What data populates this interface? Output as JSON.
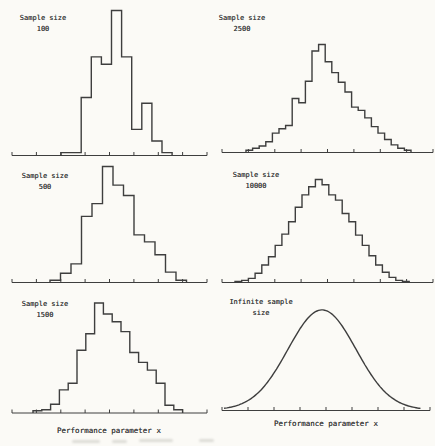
{
  "page": {
    "background": "#fbfaf6",
    "ink": "#3e3e3e"
  },
  "xlabels": {
    "left": "Performance parameter x",
    "right": "Performance parameter x"
  },
  "chart_data": [
    {
      "type": "histogram",
      "position": "top-left",
      "title_lines": [
        "Sample size",
        "100"
      ],
      "xlabel": "Performance parameter x",
      "ylabel": "",
      "tick_labels": [],
      "values": [
        0.02,
        0.02,
        0.4,
        0.68,
        0.63,
        1.0,
        0.68,
        0.18,
        0.36,
        0.1,
        0.02
      ],
      "layout": {
        "axis_x": [
          12,
          207
        ],
        "axis_y": 155.5,
        "ticks": 9,
        "bars_x0": 61,
        "bar_width": 10.1,
        "peak_height": 145
      }
    },
    {
      "type": "histogram",
      "position": "top-right",
      "title_lines": [
        "Sample size",
        "2500"
      ],
      "xlabel": "Performance parameter x",
      "ylabel": "",
      "tick_labels": [],
      "values": [
        0.02,
        0.04,
        0.06,
        0.1,
        0.18,
        0.22,
        0.25,
        0.5,
        0.46,
        0.66,
        0.94,
        1.0,
        0.84,
        0.74,
        0.65,
        0.56,
        0.42,
        0.39,
        0.32,
        0.24,
        0.18,
        0.12,
        0.07,
        0.04,
        0.02
      ],
      "layout": {
        "axis_x": [
          222,
          433
        ],
        "axis_y": 152.5,
        "ticks": 9,
        "bars_x0": 246,
        "bar_width": 6.6,
        "peak_height": 108
      }
    },
    {
      "type": "histogram",
      "position": "middle-left",
      "title_lines": [
        "Sample size",
        "500"
      ],
      "xlabel": "Performance parameter x",
      "ylabel": "",
      "tick_labels": [],
      "values": [
        0.02,
        0.08,
        0.16,
        0.57,
        0.68,
        1.0,
        0.84,
        0.75,
        0.41,
        0.35,
        0.24,
        0.09,
        0.02
      ],
      "layout": {
        "axis_x": [
          12,
          207
        ],
        "axis_y": 282.5,
        "ticks": 9,
        "bars_x0": 50,
        "bar_width": 10.5,
        "peak_height": 116
      }
    },
    {
      "type": "histogram",
      "position": "middle-right",
      "title_lines": [
        "Sample size",
        "10000"
      ],
      "xlabel": "Performance parameter x",
      "ylabel": "",
      "tick_labels": [],
      "values": [
        0.01,
        0.02,
        0.04,
        0.09,
        0.17,
        0.25,
        0.36,
        0.47,
        0.59,
        0.73,
        0.85,
        0.93,
        1.0,
        0.95,
        0.85,
        0.8,
        0.67,
        0.59,
        0.46,
        0.36,
        0.26,
        0.17,
        0.1,
        0.05,
        0.02,
        0.01
      ],
      "layout": {
        "axis_x": [
          222,
          433
        ],
        "axis_y": 282.5,
        "ticks": 9,
        "bars_x0": 235,
        "bar_width": 6.7,
        "peak_height": 103
      }
    },
    {
      "type": "histogram",
      "position": "bottom-left",
      "title_lines": [
        "Sample size",
        "1500"
      ],
      "xlabel": "Performance parameter x",
      "ylabel": "",
      "tick_labels": [],
      "values": [
        0.02,
        0.03,
        0.08,
        0.21,
        0.27,
        0.57,
        0.72,
        1.0,
        0.9,
        0.83,
        0.74,
        0.55,
        0.46,
        0.39,
        0.27,
        0.07,
        0.03
      ],
      "layout": {
        "axis_x": [
          12,
          207
        ],
        "axis_y": 413,
        "ticks": 9,
        "bars_x0": 33,
        "bar_width": 8.8,
        "peak_height": 110
      }
    },
    {
      "type": "gaussian-curve",
      "position": "bottom-right",
      "title_lines": [
        "Infinite sample",
        "size"
      ],
      "xlabel": "Performance parameter x",
      "ylabel": "",
      "tick_labels": [],
      "layout": {
        "axis_x": [
          222,
          430
        ],
        "axis_y": 410.5,
        "ticks": 9,
        "curve_x": [
          224,
          421
        ],
        "mu": 322,
        "sigma": 34,
        "peak_height": 100
      }
    }
  ]
}
